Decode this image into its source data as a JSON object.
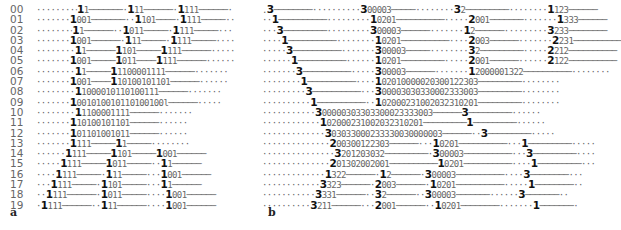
{
  "figure": {
    "panel_a": {
      "label": "a",
      "row_labels": [
        "00",
        "01",
        "02",
        "03",
        "04",
        "05",
        "06",
        "07",
        "08",
        "09",
        "10",
        "11",
        "12",
        "13",
        "14",
        "15",
        "16",
        "17",
        "18",
        "19"
      ],
      "rows": [
        "········‧1̲1───────·1̲11──────·1̲111──────·",
        "·······1̲001───────··1̲101────·1̲111─────··",
        "·······‧1̲1──────··1̲011─────·1̲111─────···",
        "·······1̲001──────·1̲11─────·1̲111─────····",
        "········1̲1──────1̲101─────1̲111──────·····",
        "·······1̲001─────1̲011────1̲111──────······",
        "········1̲1─────1̲1100001111──────·······",
        "·······1̲001────1̲10100101101──────······",
        "········1̲1000010110100111──────·······",
        "·······1̲001010010110100100l──────·····",
        "········1̲1100001111──────·······",
        "·······1̲10100101101──────······",
        "·······1̲01101001011──────······",
        "·······1̲111─────1̲1─────········",
        "······1̲111─────1̲101─────1̲001──────",
        "·····1̲111─────1̲011─────··1̲1──────",
        "····1̲111─────·1̲11─────···1̲001──────",
        "···1̲111─────·1̲101─────···1̲1──────",
        "··1̲111──────·1̲011─────····1̲001──────",
        "·1̲111──────··1̲11──────····1̲001──────"
      ]
    },
    "panel_b": {
      "label": "b",
      "rows": [
        [
          ".",
          "3",
          "────────··········",
          "3",
          "00003",
          "─────········",
          "3",
          "2─────────········",
          "1",
          "123──────"
        ],
        [
          "··",
          "1",
          "──────────·········",
          "1",
          "0201",
          "──────────·····",
          "2",
          "001───────·······",
          "1",
          "333──────"
        ],
        [
          "···",
          "3",
          "─────────·········",
          "3",
          "00003",
          "──────·······",
          "1",
          "2──────·········",
          "3",
          "233────────"
        ],
        [
          "····",
          "1",
          "──────────········",
          "1",
          "0201",
          "──────────····",
          "2",
          "003──────·······",
          "2",
          "231──────────"
        ],
        [
          "·····",
          "3",
          "──────────·······",
          "3",
          "00003",
          "─────········",
          "3",
          "2─────────·····",
          "2",
          "212──────────"
        ],
        [
          "······",
          "1",
          "──────────······",
          "1",
          "0201",
          "─────────·····",
          "2",
          "001──────······",
          "2",
          "122──────────"
        ],
        [
          "·······",
          "3",
          "──────────·····",
          "3",
          "00003",
          "──────·······",
          "1",
          "2000001322",
          "──────────········"
        ],
        [
          "········",
          "1",
          "──────────····",
          "1",
          "02010000020300122303",
          "─────────········"
        ],
        [
          "·········",
          "3",
          "──────────···",
          "3",
          "00003030330002333003",
          "─────────········"
        ],
        [
          "··········",
          "1",
          "──────────··",
          "1",
          "02000231002032310201",
          "─────────········"
        ],
        [
          "···········",
          "3",
          "00000303303300023333003",
          "──────",
          "3",
          "─────────······"
        ],
        [
          "············",
          "1",
          "02000231002032310201",
          "─────────",
          "1",
          "─────────······"
        ],
        [
          "·············",
          "3",
          "03033000233330030000003",
          "──────··",
          "3",
          "─────────·····"
        ],
        [
          "··············",
          "2",
          "00300122303",
          "──────···",
          "1",
          "0201",
          "──────────···",
          "1",
          "─────────·····"
        ],
        [
          "···············",
          "3",
          "201203032",
          "─────────·",
          "3",
          "00003",
          "──────────···",
          "3",
          "─────────····"
        ],
        [
          "··············",
          "2",
          "01302002001",
          "──────────",
          "1",
          "0201",
          "──────────····",
          "1",
          "─────────···"
        ],
        [
          "·············",
          "1",
          "322",
          "──────·",
          "1",
          "2──────·",
          "3",
          "00003",
          "──────────····",
          "3",
          "────────···"
        ],
        [
          "············",
          "3",
          "323",
          "──────·",
          "2",
          "003──────·",
          "1",
          "0201",
          "──────────·····",
          "1",
          "────────··"
        ],
        [
          "···········",
          "3",
          "331",
          "──────··",
          "3",
          "2──────··",
          "3",
          "00003",
          "───────······",
          "3",
          "───────··"
        ],
        [
          "··········",
          "3",
          "211",
          "──────···",
          "2",
          "001──────··",
          "1",
          "0201",
          "────────·······",
          "1",
          "───────·"
        ]
      ]
    }
  }
}
